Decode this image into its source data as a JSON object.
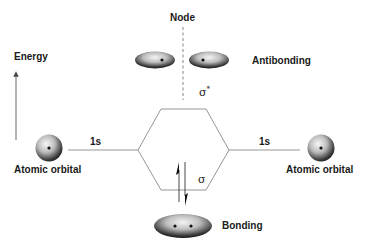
{
  "diagram": {
    "axis": {
      "label": "Energy",
      "direction": "up"
    },
    "node": {
      "label": "Node"
    },
    "antibonding": {
      "label": "Antibonding",
      "symbol": "σ",
      "symbol_sup": "*"
    },
    "bonding": {
      "label": "Bonding",
      "symbol": "σ",
      "electrons": "↑↓"
    },
    "left_atom": {
      "label": "Atomic orbital",
      "orbital": "1s"
    },
    "right_atom": {
      "label": "Atomic orbital",
      "orbital": "1s"
    }
  },
  "colors": {
    "line": "#8a8a8a",
    "text": "#1a1a1a",
    "sphere_light": "#f4f4f4",
    "sphere_dark": "#1e1e1e",
    "nucleus": "#111111"
  }
}
